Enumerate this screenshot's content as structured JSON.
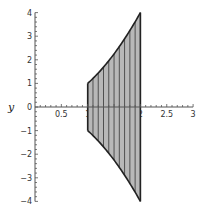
{
  "chart_data": {
    "type": "area",
    "title": "",
    "xlabel": "",
    "ylabel": "y",
    "xlim": [
      0,
      3
    ],
    "ylim": [
      -4,
      4
    ],
    "x_ticks": [
      0.5,
      1,
      1.5,
      2,
      2.5,
      3
    ],
    "x_tick_labels": [
      "0.5",
      "1",
      "1.5",
      "2",
      "2.5",
      "3"
    ],
    "y_ticks": [
      -4,
      -3,
      -2,
      -1,
      0,
      1,
      2,
      3,
      4
    ],
    "y_tick_labels": [
      "-4",
      "-3",
      "-2",
      "-1",
      "0",
      "1",
      "2",
      "3",
      "4"
    ],
    "grid": false,
    "legend": null,
    "region": {
      "description": "Shaded region between y = -x^2 and y = x^2 for 1 <= x <= 2, with vertical hatch lines",
      "x_range": [
        1,
        2
      ],
      "upper_curve": "y = x^2",
      "lower_curve": "y = -x^2",
      "fill_color": "#b8b8b8",
      "edge_color": "#222222",
      "hatch_x": [
        1.0,
        1.1,
        1.2,
        1.3,
        1.4,
        1.5,
        1.6,
        1.7,
        1.8,
        1.9,
        2.0
      ]
    },
    "series": [
      {
        "name": "upper boundary",
        "x": [
          1.0,
          1.1,
          1.2,
          1.3,
          1.4,
          1.5,
          1.6,
          1.7,
          1.8,
          1.9,
          2.0
        ],
        "values": [
          1.0,
          1.21,
          1.44,
          1.69,
          1.96,
          2.25,
          2.56,
          2.89,
          3.24,
          3.61,
          4.0
        ]
      },
      {
        "name": "lower boundary",
        "x": [
          1.0,
          1.1,
          1.2,
          1.3,
          1.4,
          1.5,
          1.6,
          1.7,
          1.8,
          1.9,
          2.0
        ],
        "values": [
          -1.0,
          -1.21,
          -1.44,
          -1.69,
          -1.96,
          -2.25,
          -2.56,
          -2.89,
          -3.24,
          -3.61,
          -4.0
        ]
      }
    ]
  }
}
